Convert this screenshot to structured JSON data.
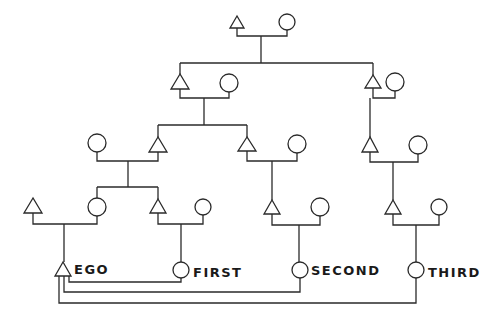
{
  "diagram": {
    "type": "kinship-diagram",
    "labels": {
      "ego": "EGO",
      "first": "FIRST",
      "second": "SECOND",
      "third": "THIRD"
    },
    "legend_symbols": {
      "male": "triangle",
      "female": "circle"
    },
    "colors": {
      "line": "#2a2a2a",
      "background": "#ffffff"
    }
  }
}
